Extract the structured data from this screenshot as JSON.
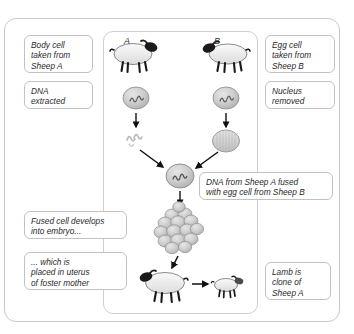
{
  "diagram": {
    "panel_letters": [
      {
        "label": "A",
        "x": 124,
        "y": 36
      },
      {
        "label": "B",
        "x": 214,
        "y": 36
      }
    ],
    "labels": [
      {
        "name": "body-cell-label",
        "text": "Body cell\ntaken from\nSheep A",
        "x": 24,
        "y": 35,
        "w": 69,
        "h": 38
      },
      {
        "name": "dna-extracted-label",
        "text": "DNA\nextracted",
        "x": 24,
        "y": 81,
        "w": 69,
        "h": 28
      },
      {
        "name": "egg-cell-label",
        "text": "Egg cell\ntaken from\nSheep B",
        "x": 265,
        "y": 35,
        "w": 70,
        "h": 38
      },
      {
        "name": "nucleus-removed-label",
        "text": "Nucleus\nremoved",
        "x": 265,
        "y": 81,
        "w": 70,
        "h": 28
      },
      {
        "name": "dna-fused-label",
        "text": "DNA from Sheep A fused\nwith egg cell from Sheep B",
        "x": 199,
        "y": 172,
        "w": 134,
        "h": 28
      },
      {
        "name": "fused-cell-embryo-label",
        "text": "Fused cell develops\ninto embryo...",
        "x": 24,
        "y": 211,
        "w": 103,
        "h": 28
      },
      {
        "name": "uterus-foster-mother-label",
        "text": "... which is\nplaced in uterus\nof foster mother",
        "x": 24,
        "y": 252,
        "w": 103,
        "h": 38
      },
      {
        "name": "lamb-clone-label",
        "text": "Lamb is\nclone of\nSheep A",
        "x": 265,
        "y": 262,
        "w": 66,
        "h": 38
      }
    ],
    "stages": [
      {
        "name": "sheep-a",
        "description": "Adult donor sheep A, body cell source"
      },
      {
        "name": "sheep-b",
        "description": "Adult sheep B, egg cell source"
      },
      {
        "name": "nucleus-a",
        "description": "Nucleus with DNA extracted from Sheep A body cell"
      },
      {
        "name": "nucleus-b",
        "description": "Nucleus of Sheep B egg cell before removal"
      },
      {
        "name": "dna-strands",
        "description": "Free DNA strands extracted from Sheep A"
      },
      {
        "name": "enucleated-egg",
        "description": "Egg cell from Sheep B with nucleus removed"
      },
      {
        "name": "fused-cell",
        "description": "Fused cell containing Sheep A DNA in Sheep B egg"
      },
      {
        "name": "embryo",
        "description": "Multi-cell embryo developed from fused cell"
      },
      {
        "name": "foster-mother",
        "description": "Foster mother ewe carrying embryo in uterus"
      },
      {
        "name": "lamb",
        "description": "Lamb that is a clone of Sheep A"
      }
    ],
    "colors": {
      "frame_border": "#c9c9c9",
      "label_border": "#c2c2c2",
      "text": "#2b2b2b",
      "arrow": "#111111",
      "cell_fill": "#c9c9c9",
      "cell_stroke": "#8a8a8a",
      "sheep_body": "#efefef",
      "sheep_head": "#1a1a1a",
      "background": "#ffffff"
    }
  }
}
